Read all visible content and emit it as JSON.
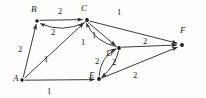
{
  "figure": {
    "type": "directed-weighted-graph",
    "background_color": "#fdfdfb",
    "stroke_color": "#262626",
    "text_color": "#1a1a1a"
  },
  "vertices": [
    {
      "id": "A",
      "label": "A",
      "x": 22,
      "y": 80,
      "label_x": 13,
      "label_y": 74
    },
    {
      "id": "B",
      "label": "B",
      "x": 37,
      "y": 21,
      "label_x": 31,
      "label_y": 5
    },
    {
      "id": "C",
      "label": "C",
      "x": 87,
      "y": 20,
      "label_x": 81,
      "label_y": 4
    },
    {
      "id": "D",
      "label": "D",
      "x": 119,
      "y": 48,
      "label_x": 106,
      "label_y": 49
    },
    {
      "id": "E",
      "label": "E",
      "x": 99,
      "y": 79,
      "label_x": 89,
      "label_y": 71
    },
    {
      "id": "F",
      "label": "F",
      "x": 182,
      "y": 45,
      "label_x": 180,
      "label_y": 26
    }
  ],
  "edges": [
    {
      "id": "B-C",
      "from": "B",
      "to": "C",
      "weight": "2",
      "curve": "straight",
      "label_x": 58,
      "label_y": 7
    },
    {
      "id": "C-B",
      "from": "C",
      "to": "B",
      "weight": "2",
      "curve": "arc-down",
      "label_x": 51,
      "label_y": 28
    },
    {
      "id": "A-B",
      "from": "A",
      "to": "B",
      "weight": "2",
      "curve": "straight",
      "label_x": 18,
      "label_y": 45
    },
    {
      "id": "A-C",
      "from": "A",
      "to": "C",
      "weight": "1",
      "curve": "straight",
      "label_x": 44,
      "label_y": 55
    },
    {
      "id": "A-E",
      "from": "A",
      "to": "E",
      "weight": "1",
      "curve": "straight",
      "label_x": 47,
      "label_y": 87
    },
    {
      "id": "C-F",
      "from": "C",
      "to": "F",
      "weight": "1",
      "curve": "straight",
      "label_x": 117,
      "label_y": 8
    },
    {
      "id": "C-D",
      "from": "C",
      "to": "D",
      "weight": "1",
      "curve": "straight",
      "label_x": 92,
      "label_y": 31
    },
    {
      "id": "D-C",
      "from": "D",
      "to": "C",
      "weight": "1",
      "curve": "arc-left",
      "label_x": 81,
      "label_y": 38
    },
    {
      "id": "D-F",
      "from": "D",
      "to": "F",
      "weight": "2",
      "curve": "straight",
      "label_x": 143,
      "label_y": 37
    },
    {
      "id": "E-D",
      "from": "E",
      "to": "D",
      "weight": "2",
      "curve": "arc-left",
      "label_x": 95,
      "label_y": 57
    },
    {
      "id": "D-E",
      "from": "D",
      "to": "E",
      "weight": "2",
      "curve": "arc-right",
      "label_x": 112,
      "label_y": 58
    },
    {
      "id": "E-F",
      "from": "E",
      "to": "F",
      "weight": "2",
      "curve": "straight",
      "label_x": 133,
      "label_y": 71
    }
  ]
}
